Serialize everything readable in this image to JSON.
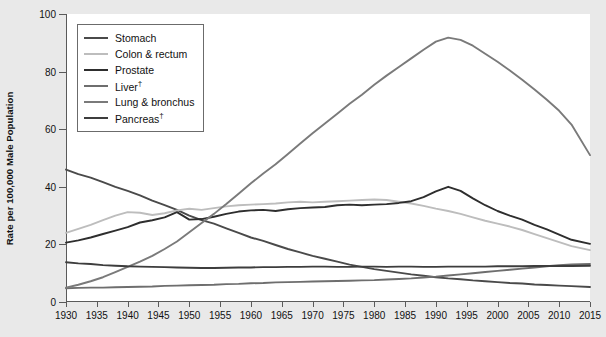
{
  "chart_data": {
    "type": "line",
    "title": "",
    "xlabel": "",
    "ylabel": "Rate per 100,000 Male Population",
    "xlim": [
      1930,
      2015
    ],
    "ylim": [
      0,
      100
    ],
    "ytick_values": [
      0,
      20,
      40,
      60,
      80,
      100
    ],
    "xtick_values": [
      1930,
      1935,
      1940,
      1945,
      1950,
      1955,
      1960,
      1965,
      1970,
      1975,
      1980,
      1985,
      1990,
      1995,
      2000,
      2005,
      2010,
      2015
    ],
    "grid": false,
    "legend_position": "upper-left-inside",
    "x": [
      1930,
      1932,
      1934,
      1936,
      1938,
      1940,
      1942,
      1944,
      1946,
      1948,
      1950,
      1952,
      1954,
      1956,
      1958,
      1960,
      1962,
      1964,
      1966,
      1968,
      1970,
      1972,
      1974,
      1976,
      1978,
      1980,
      1982,
      1984,
      1986,
      1988,
      1990,
      1992,
      1994,
      1996,
      1998,
      2000,
      2002,
      2004,
      2006,
      2008,
      2010,
      2012,
      2015
    ],
    "series": [
      {
        "name": "Stomach",
        "color": "#4a4a4a",
        "values": [
          46.0,
          44.4,
          43.2,
          41.6,
          40.0,
          38.6,
          37.0,
          35.2,
          33.6,
          32.0,
          30.0,
          28.4,
          27.2,
          25.6,
          24.0,
          22.4,
          21.2,
          19.8,
          18.4,
          17.2,
          16.0,
          15.0,
          14.0,
          13.0,
          12.2,
          11.4,
          10.8,
          10.2,
          9.6,
          9.1,
          8.6,
          8.2,
          7.9,
          7.5,
          7.2,
          6.9,
          6.6,
          6.4,
          6.1,
          5.9,
          5.7,
          5.5,
          5.2
        ]
      },
      {
        "name": "Colon & rectum",
        "color": "#bdbdbd",
        "values": [
          24.0,
          25.4,
          26.8,
          28.4,
          30.0,
          31.2,
          31.0,
          30.2,
          30.8,
          31.8,
          32.4,
          32.0,
          32.6,
          33.2,
          33.6,
          33.8,
          34.0,
          34.2,
          34.6,
          34.8,
          34.6,
          34.8,
          35.0,
          35.2,
          35.4,
          35.6,
          35.4,
          34.8,
          34.2,
          33.4,
          32.4,
          31.6,
          30.6,
          29.4,
          28.2,
          27.2,
          26.2,
          25.0,
          23.6,
          22.2,
          20.8,
          19.4,
          18.0
        ]
      },
      {
        "name": "Prostate",
        "color": "#2e2e2e",
        "values": [
          20.6,
          21.4,
          22.4,
          23.6,
          24.8,
          26.0,
          27.6,
          28.4,
          29.4,
          31.2,
          28.6,
          28.8,
          29.6,
          30.6,
          31.4,
          31.8,
          32.0,
          31.6,
          32.2,
          32.6,
          32.8,
          33.0,
          33.6,
          33.8,
          33.6,
          33.8,
          34.0,
          34.4,
          35.0,
          36.4,
          38.4,
          40.0,
          38.6,
          36.0,
          33.6,
          31.6,
          30.0,
          28.6,
          26.8,
          25.2,
          23.4,
          21.6,
          20.2
        ]
      },
      {
        "name": "Liver",
        "color": "#6e6e6e",
        "values": [
          4.8,
          4.9,
          5.0,
          5.0,
          5.1,
          5.2,
          5.3,
          5.4,
          5.6,
          5.7,
          5.8,
          5.9,
          6.0,
          6.2,
          6.3,
          6.5,
          6.6,
          6.8,
          6.9,
          7.0,
          7.1,
          7.2,
          7.3,
          7.4,
          7.5,
          7.6,
          7.8,
          8.0,
          8.2,
          8.5,
          8.8,
          9.2,
          9.6,
          10.0,
          10.4,
          10.8,
          11.2,
          11.6,
          12.0,
          12.4,
          12.8,
          13.0,
          13.2
        ]
      },
      {
        "name": "Lung & bronchus",
        "color": "#7a7a7a",
        "values": [
          5.0,
          6.0,
          7.2,
          8.6,
          10.4,
          12.2,
          14.0,
          16.0,
          18.4,
          21.0,
          24.2,
          27.4,
          30.6,
          34.0,
          37.6,
          41.2,
          44.6,
          47.8,
          51.4,
          55.0,
          58.6,
          62.0,
          65.4,
          68.8,
          72.0,
          75.4,
          78.6,
          81.6,
          84.6,
          87.6,
          90.4,
          91.8,
          91.0,
          89.0,
          86.2,
          83.4,
          80.4,
          77.2,
          73.8,
          70.2,
          66.4,
          61.6,
          51.0
        ]
      },
      {
        "name": "Pancreas",
        "color": "#3d3d3d",
        "values": [
          13.8,
          13.4,
          13.2,
          12.8,
          12.6,
          12.4,
          12.3,
          12.2,
          12.1,
          12.0,
          11.9,
          11.8,
          11.8,
          11.9,
          12.0,
          12.0,
          12.1,
          12.1,
          12.2,
          12.2,
          12.3,
          12.3,
          12.2,
          12.2,
          12.3,
          12.3,
          12.2,
          12.3,
          12.3,
          12.2,
          12.2,
          12.3,
          12.3,
          12.3,
          12.3,
          12.4,
          12.4,
          12.4,
          12.5,
          12.5,
          12.5,
          12.5,
          12.6
        ]
      }
    ]
  },
  "legend": {
    "items": [
      {
        "label": "Stomach",
        "dagger": ""
      },
      {
        "label": "Colon & rectum",
        "dagger": ""
      },
      {
        "label": "Prostate",
        "dagger": ""
      },
      {
        "label": "Liver",
        "dagger": "†"
      },
      {
        "label": "Lung & bronchus",
        "dagger": ""
      },
      {
        "label": "Pancreas",
        "dagger": "†"
      }
    ]
  }
}
